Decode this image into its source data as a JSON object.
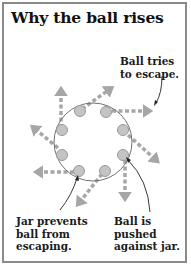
{
  "title": "Why the ball rises",
  "labels": {
    "ball_tries": "Ball tries\nto escape.",
    "jar_prevents": "Jar prevents\nball from\nescaping.",
    "ball_pushed": "Ball is\npushed\nagainst jar."
  },
  "colors": {
    "border": "#8a8a8a",
    "arrow": "#a6a6a6",
    "ball_fill": "#c4c4c4",
    "ball_stroke": "#9a9a9a",
    "jar": "#707070",
    "pointer": "#222222"
  },
  "jar": {
    "cx": 93,
    "cy": 142,
    "r": 39
  },
  "balls": [
    {
      "id": "top-left",
      "x": 80,
      "y": 111
    },
    {
      "id": "top-right",
      "x": 106,
      "y": 112
    },
    {
      "id": "right-upper",
      "x": 123,
      "y": 130
    },
    {
      "id": "right-lower",
      "x": 123,
      "y": 155
    },
    {
      "id": "bottom-right",
      "x": 105,
      "y": 171
    },
    {
      "id": "bottom-left",
      "x": 79,
      "y": 171
    },
    {
      "id": "left-lower",
      "x": 62,
      "y": 155
    },
    {
      "id": "left-upper",
      "x": 62,
      "y": 130
    }
  ]
}
